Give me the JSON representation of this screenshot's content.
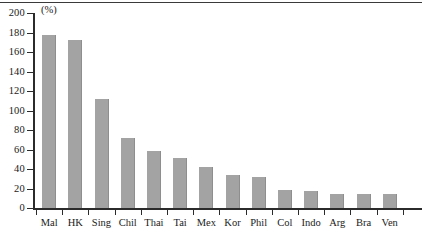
{
  "chart_data": {
    "type": "bar",
    "title": "",
    "subtitle": "",
    "xlabel": "",
    "ylabel": "",
    "unit_label": "(%)",
    "categories": [
      "Mal",
      "HK",
      "Sing",
      "Chil",
      "Thai",
      "Tai",
      "Mex",
      "Kor",
      "Phil",
      "Col",
      "Indo",
      "Arg",
      "Bra",
      "Ven"
    ],
    "values": [
      177,
      172,
      112,
      72,
      58,
      51,
      42,
      34,
      32,
      18,
      17,
      14,
      14,
      14
    ],
    "ylim": [
      0,
      200
    ],
    "ytick_labels": [
      "200",
      "180",
      "160",
      "140",
      "120",
      "100",
      "80",
      "60",
      "40",
      "20",
      "0"
    ],
    "ytick_values": [
      200,
      180,
      160,
      140,
      120,
      100,
      80,
      60,
      40,
      20,
      0
    ],
    "grid": false,
    "legend": null,
    "bar_color": "#a3a3a3",
    "axis_color": "#2b2b2b"
  }
}
